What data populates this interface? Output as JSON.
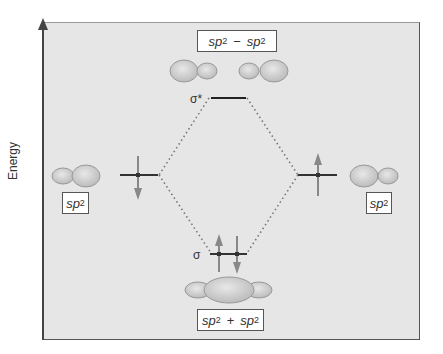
{
  "diagram": {
    "type": "molecular-orbital-energy-diagram",
    "y_axis_label": "Energy",
    "colors": {
      "background": "#e6e6e6",
      "line": "#333333",
      "arrow": "#888888",
      "orbital_fill": "#d0d0d0",
      "dotted": "#777777"
    },
    "antibonding": {
      "label": "σ*",
      "combination": {
        "a": "sp",
        "a_sup": "2",
        "op": "−",
        "b": "sp",
        "b_sup": "2"
      }
    },
    "bonding": {
      "label": "σ",
      "combination": {
        "a": "sp",
        "a_sup": "2",
        "op": "+",
        "b": "sp",
        "b_sup": "2"
      },
      "electrons": [
        "up",
        "down"
      ]
    },
    "left_atomic": {
      "orbital": "sp",
      "sup": "2",
      "electrons": [
        "down"
      ]
    },
    "right_atomic": {
      "orbital": "sp",
      "sup": "2",
      "electrons": [
        "up"
      ]
    }
  }
}
